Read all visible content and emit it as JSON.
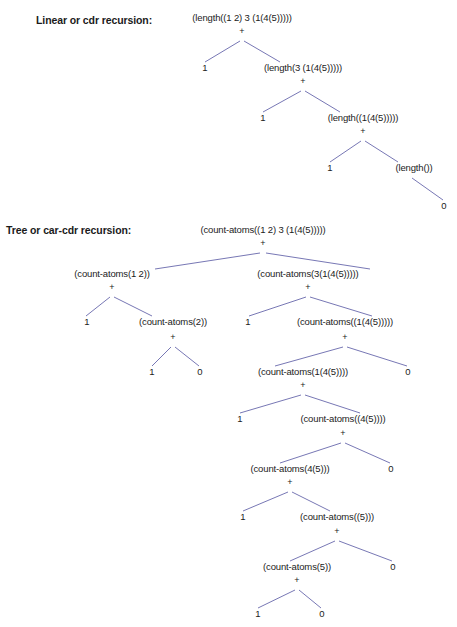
{
  "page": {
    "background": "#ffffff",
    "text_color": "#1b1b1b",
    "edge_color": "#5f5fa6"
  },
  "sections": [
    {
      "id": "linear",
      "label": "Linear or cdr recursion:",
      "label_x": 36,
      "label_y": 24,
      "operator": "+"
    },
    {
      "id": "tree",
      "label": "Tree or car-cdr recursion:",
      "label_x": 6,
      "label_y": 234,
      "operator": "+"
    }
  ],
  "linear_tree": {
    "nodes": [
      {
        "name": "linear-root",
        "text": "(length((1 2) 3 (1(4(5)))))",
        "x": 242,
        "y": 21,
        "anchor": "middle",
        "kind": "call"
      },
      {
        "name": "linear-root-plus",
        "text": "+",
        "x": 242,
        "y": 34,
        "anchor": "middle",
        "kind": "operator"
      },
      {
        "name": "linear-l1-left",
        "text": "1",
        "x": 205,
        "y": 71,
        "anchor": "middle",
        "kind": "leaf"
      },
      {
        "name": "linear-l1-right",
        "text": "(length(3 (1(4(5)))))",
        "x": 303,
        "y": 71,
        "anchor": "middle",
        "kind": "call"
      },
      {
        "name": "linear-l1-plus",
        "text": "+",
        "x": 303,
        "y": 84,
        "anchor": "middle",
        "kind": "operator"
      },
      {
        "name": "linear-l2-left",
        "text": "1",
        "x": 263,
        "y": 121,
        "anchor": "middle",
        "kind": "leaf"
      },
      {
        "name": "linear-l2-right",
        "text": "(length((1(4(5)))))",
        "x": 363,
        "y": 121,
        "anchor": "middle",
        "kind": "call"
      },
      {
        "name": "linear-l2-plus",
        "text": "+",
        "x": 363,
        "y": 134,
        "anchor": "middle",
        "kind": "operator"
      },
      {
        "name": "linear-l3-left",
        "text": "1",
        "x": 330,
        "y": 171,
        "anchor": "middle",
        "kind": "leaf"
      },
      {
        "name": "linear-l3-right",
        "text": "(length())",
        "x": 414,
        "y": 171,
        "anchor": "middle",
        "kind": "call"
      },
      {
        "name": "linear-l4-right",
        "text": "0",
        "x": 444,
        "y": 209,
        "anchor": "middle",
        "kind": "leaf"
      }
    ],
    "edges": [
      {
        "name": "linear-edge-root-left",
        "x1": 240,
        "y1": 41,
        "x2": 205,
        "y2": 62
      },
      {
        "name": "linear-edge-root-right",
        "x1": 244,
        "y1": 41,
        "x2": 280,
        "y2": 62
      },
      {
        "name": "linear-edge-l1-left",
        "x1": 301,
        "y1": 91,
        "x2": 263,
        "y2": 112
      },
      {
        "name": "linear-edge-l1-right",
        "x1": 305,
        "y1": 91,
        "x2": 340,
        "y2": 112
      },
      {
        "name": "linear-edge-l2-left",
        "x1": 361,
        "y1": 141,
        "x2": 330,
        "y2": 162
      },
      {
        "name": "linear-edge-l2-right",
        "x1": 365,
        "y1": 141,
        "x2": 398,
        "y2": 162
      },
      {
        "name": "linear-edge-l3-right",
        "x1": 412,
        "y1": 178,
        "x2": 443,
        "y2": 200
      }
    ]
  },
  "tree_tree": {
    "nodes": [
      {
        "name": "tree-root",
        "text": "(count-atoms((1 2) 3 (1(4(5)))))",
        "x": 263,
        "y": 233,
        "anchor": "middle",
        "kind": "call"
      },
      {
        "name": "tree-root-plus",
        "text": "+",
        "x": 263,
        "y": 246,
        "anchor": "middle",
        "kind": "operator"
      },
      {
        "name": "tree-l1-left",
        "text": "(count-atoms(1 2))",
        "x": 112,
        "y": 277,
        "anchor": "middle",
        "kind": "call"
      },
      {
        "name": "tree-l1-left-plus",
        "text": "+",
        "x": 112,
        "y": 290,
        "anchor": "middle",
        "kind": "operator"
      },
      {
        "name": "tree-l1-right",
        "text": "(count-atoms(3(1(4(5)))))",
        "x": 308,
        "y": 277,
        "anchor": "middle",
        "kind": "call"
      },
      {
        "name": "tree-l1-right-plus",
        "text": "+",
        "x": 308,
        "y": 290,
        "anchor": "middle",
        "kind": "operator"
      },
      {
        "name": "tree-l2-a",
        "text": "1",
        "x": 87,
        "y": 325,
        "anchor": "middle",
        "kind": "leaf"
      },
      {
        "name": "tree-l2-b",
        "text": "(count-atoms(2))",
        "x": 173,
        "y": 325,
        "anchor": "middle",
        "kind": "call"
      },
      {
        "name": "tree-l2-b-plus",
        "text": "+",
        "x": 173,
        "y": 340,
        "anchor": "middle",
        "kind": "operator"
      },
      {
        "name": "tree-l2-c",
        "text": "1",
        "x": 248,
        "y": 325,
        "anchor": "middle",
        "kind": "leaf"
      },
      {
        "name": "tree-l2-d",
        "text": "(count-atoms((1(4(5)))))",
        "x": 345,
        "y": 325,
        "anchor": "middle",
        "kind": "call"
      },
      {
        "name": "tree-l2-d-plus",
        "text": "+",
        "x": 345,
        "y": 340,
        "anchor": "middle",
        "kind": "operator"
      },
      {
        "name": "tree-l3-a",
        "text": "1",
        "x": 152,
        "y": 375,
        "anchor": "middle",
        "kind": "leaf"
      },
      {
        "name": "tree-l3-b",
        "text": "0",
        "x": 200,
        "y": 375,
        "anchor": "middle",
        "kind": "leaf"
      },
      {
        "name": "tree-l3-c",
        "text": "(count-atoms(1(4(5))))",
        "x": 303,
        "y": 375,
        "anchor": "middle",
        "kind": "call"
      },
      {
        "name": "tree-l3-c-plus",
        "text": "+",
        "x": 303,
        "y": 388,
        "anchor": "middle",
        "kind": "operator"
      },
      {
        "name": "tree-l3-d",
        "text": "0",
        "x": 408,
        "y": 375,
        "anchor": "middle",
        "kind": "leaf"
      },
      {
        "name": "tree-l4-a",
        "text": "1",
        "x": 240,
        "y": 422,
        "anchor": "middle",
        "kind": "leaf"
      },
      {
        "name": "tree-l4-b",
        "text": "(count-atoms((4(5))))",
        "x": 343,
        "y": 422,
        "anchor": "middle",
        "kind": "call"
      },
      {
        "name": "tree-l4-b-plus",
        "text": "+",
        "x": 343,
        "y": 436,
        "anchor": "middle",
        "kind": "operator"
      },
      {
        "name": "tree-l5-a",
        "text": "(count-atoms(4(5)))",
        "x": 290,
        "y": 472,
        "anchor": "middle",
        "kind": "call"
      },
      {
        "name": "tree-l5-a-plus",
        "text": "+",
        "x": 290,
        "y": 485,
        "anchor": "middle",
        "kind": "operator"
      },
      {
        "name": "tree-l5-b",
        "text": "0",
        "x": 391,
        "y": 472,
        "anchor": "middle",
        "kind": "leaf"
      },
      {
        "name": "tree-l6-a",
        "text": "1",
        "x": 243,
        "y": 520,
        "anchor": "middle",
        "kind": "leaf"
      },
      {
        "name": "tree-l6-b",
        "text": "(count-atoms((5)))",
        "x": 337,
        "y": 520,
        "anchor": "middle",
        "kind": "call"
      },
      {
        "name": "tree-l6-b-plus",
        "text": "+",
        "x": 337,
        "y": 534,
        "anchor": "middle",
        "kind": "operator"
      },
      {
        "name": "tree-l7-a",
        "text": "(count-atoms(5))",
        "x": 297,
        "y": 570,
        "anchor": "middle",
        "kind": "call"
      },
      {
        "name": "tree-l7-a-plus",
        "text": "+",
        "x": 297,
        "y": 583,
        "anchor": "middle",
        "kind": "operator"
      },
      {
        "name": "tree-l7-b",
        "text": "0",
        "x": 393,
        "y": 570,
        "anchor": "middle",
        "kind": "leaf"
      },
      {
        "name": "tree-l8-a",
        "text": "1",
        "x": 258,
        "y": 617,
        "anchor": "middle",
        "kind": "leaf"
      },
      {
        "name": "tree-l8-b",
        "text": "0",
        "x": 322,
        "y": 617,
        "anchor": "middle",
        "kind": "leaf"
      }
    ],
    "edges": [
      {
        "name": "tree-edge-root-left",
        "x1": 260,
        "y1": 253,
        "x2": 155,
        "y2": 269
      },
      {
        "name": "tree-edge-root-right",
        "x1": 266,
        "y1": 253,
        "x2": 370,
        "y2": 269
      },
      {
        "name": "tree-edge-l1l-left",
        "x1": 110,
        "y1": 297,
        "x2": 86,
        "y2": 316
      },
      {
        "name": "tree-edge-l1l-right",
        "x1": 114,
        "y1": 297,
        "x2": 152,
        "y2": 316
      },
      {
        "name": "tree-edge-l1r-left",
        "x1": 306,
        "y1": 297,
        "x2": 249,
        "y2": 316
      },
      {
        "name": "tree-edge-l1r-right",
        "x1": 310,
        "y1": 297,
        "x2": 372,
        "y2": 316
      },
      {
        "name": "tree-edge-l2b-left",
        "x1": 171,
        "y1": 347,
        "x2": 152,
        "y2": 366
      },
      {
        "name": "tree-edge-l2b-right",
        "x1": 175,
        "y1": 347,
        "x2": 199,
        "y2": 366
      },
      {
        "name": "tree-edge-l2d-left",
        "x1": 343,
        "y1": 347,
        "x2": 275,
        "y2": 366
      },
      {
        "name": "tree-edge-l2d-right",
        "x1": 347,
        "y1": 347,
        "x2": 407,
        "y2": 366
      },
      {
        "name": "tree-edge-l3c-left",
        "x1": 301,
        "y1": 395,
        "x2": 240,
        "y2": 413
      },
      {
        "name": "tree-edge-l3c-right",
        "x1": 305,
        "y1": 395,
        "x2": 360,
        "y2": 413
      },
      {
        "name": "tree-edge-l4b-left",
        "x1": 341,
        "y1": 443,
        "x2": 280,
        "y2": 463
      },
      {
        "name": "tree-edge-l4b-right",
        "x1": 345,
        "y1": 443,
        "x2": 390,
        "y2": 463
      },
      {
        "name": "tree-edge-l5a-left",
        "x1": 288,
        "y1": 492,
        "x2": 243,
        "y2": 511
      },
      {
        "name": "tree-edge-l5a-right",
        "x1": 292,
        "y1": 492,
        "x2": 330,
        "y2": 511
      },
      {
        "name": "tree-edge-l6b-left",
        "x1": 335,
        "y1": 541,
        "x2": 290,
        "y2": 561
      },
      {
        "name": "tree-edge-l6b-right",
        "x1": 339,
        "y1": 541,
        "x2": 392,
        "y2": 561
      },
      {
        "name": "tree-edge-l7a-left",
        "x1": 295,
        "y1": 590,
        "x2": 258,
        "y2": 608
      },
      {
        "name": "tree-edge-l7a-right",
        "x1": 299,
        "y1": 590,
        "x2": 321,
        "y2": 608
      }
    ]
  }
}
